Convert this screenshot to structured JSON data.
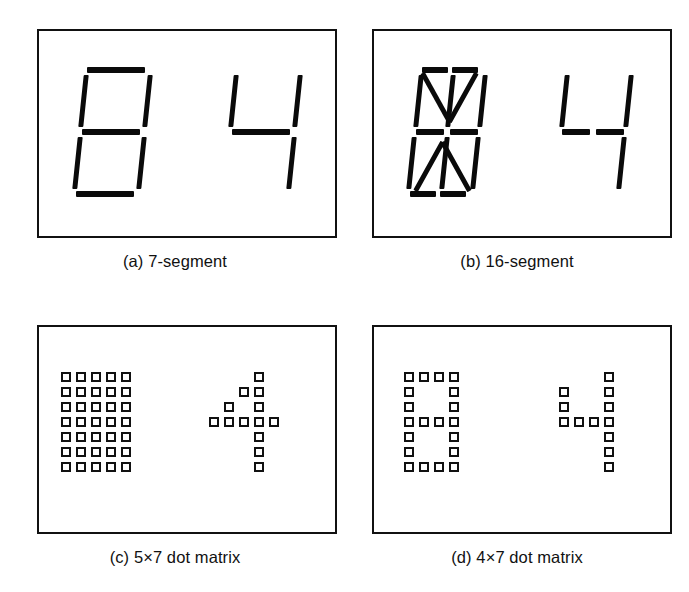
{
  "figure": {
    "background_color": "#ffffff",
    "ink_color": "#111111",
    "panel_count": 4
  },
  "panels": [
    {
      "id": "panel-a",
      "caption": "(a) 7-segment",
      "display_type": "7-segment",
      "glyphs": [
        {
          "name": "all-segments-on",
          "character": "8",
          "segments_on": [
            "a",
            "b",
            "c",
            "d",
            "e",
            "f",
            "g"
          ]
        },
        {
          "name": "digit-four",
          "character": "4",
          "segments_on": [
            "f",
            "b",
            "g",
            "c"
          ]
        }
      ]
    },
    {
      "id": "panel-b",
      "caption": "(b) 16-segment",
      "display_type": "16-segment",
      "glyphs": [
        {
          "name": "all-segments-on",
          "character": "all",
          "segments_on": [
            "a1",
            "a2",
            "b",
            "c",
            "d1",
            "d2",
            "e",
            "f",
            "g1",
            "g2",
            "h",
            "i",
            "j",
            "k",
            "l",
            "m"
          ]
        },
        {
          "name": "digit-four",
          "character": "4",
          "segments_on": [
            "f",
            "b",
            "g1",
            "g2",
            "c"
          ]
        }
      ]
    },
    {
      "id": "panel-c",
      "caption": "(c) 5×7 dot matrix",
      "display_type": "5x7 dot matrix",
      "columns": 5,
      "rows": 7,
      "glyphs": [
        {
          "name": "all-dots-on",
          "character": "all",
          "matrix": [
            [
              1,
              1,
              1,
              1,
              1
            ],
            [
              1,
              1,
              1,
              1,
              1
            ],
            [
              1,
              1,
              1,
              1,
              1
            ],
            [
              1,
              1,
              1,
              1,
              1
            ],
            [
              1,
              1,
              1,
              1,
              1
            ],
            [
              1,
              1,
              1,
              1,
              1
            ],
            [
              1,
              1,
              1,
              1,
              1
            ]
          ]
        },
        {
          "name": "digit-four",
          "character": "4",
          "matrix": [
            [
              0,
              0,
              0,
              1,
              0
            ],
            [
              0,
              0,
              1,
              1,
              0
            ],
            [
              0,
              1,
              0,
              1,
              0
            ],
            [
              1,
              1,
              1,
              1,
              1
            ],
            [
              0,
              0,
              0,
              1,
              0
            ],
            [
              0,
              0,
              0,
              1,
              0
            ],
            [
              0,
              0,
              0,
              1,
              0
            ]
          ]
        }
      ]
    },
    {
      "id": "panel-d",
      "caption": "(d) 4×7 dot matrix",
      "display_type": "4x7 dot matrix",
      "columns": 4,
      "rows": 7,
      "glyphs": [
        {
          "name": "digit-eight",
          "character": "8",
          "matrix": [
            [
              1,
              1,
              1,
              1
            ],
            [
              1,
              0,
              0,
              1
            ],
            [
              1,
              0,
              0,
              1
            ],
            [
              1,
              1,
              1,
              1
            ],
            [
              1,
              0,
              0,
              1
            ],
            [
              1,
              0,
              0,
              1
            ],
            [
              1,
              1,
              1,
              1
            ]
          ]
        },
        {
          "name": "digit-four",
          "character": "4",
          "matrix": [
            [
              0,
              0,
              0,
              1
            ],
            [
              1,
              0,
              0,
              1
            ],
            [
              1,
              0,
              0,
              1
            ],
            [
              1,
              1,
              1,
              1
            ],
            [
              0,
              0,
              0,
              1
            ],
            [
              0,
              0,
              0,
              1
            ],
            [
              0,
              0,
              0,
              1
            ]
          ]
        }
      ]
    }
  ]
}
